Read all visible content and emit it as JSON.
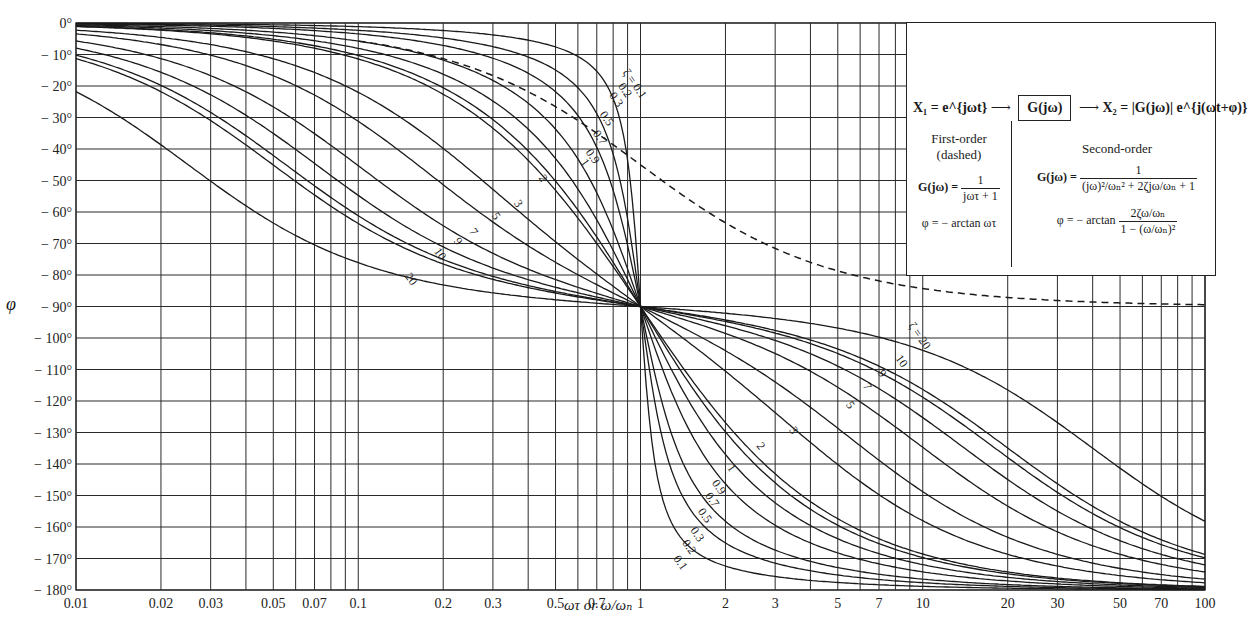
{
  "chart_data": {
    "type": "line",
    "title": "",
    "xlabel": "ωτ or ω/ω_n",
    "ylabel": "φ",
    "x_scale": "log",
    "xlim": [
      0.01,
      100
    ],
    "ylim": [
      -180,
      0
    ],
    "grid": true,
    "x_ticks": [
      "0.01",
      "0.02",
      "0.03",
      "0.05",
      "0.07",
      "0.1",
      "0.2",
      "0.3",
      "0.5",
      "0.7",
      "1",
      "2",
      "3",
      "5",
      "7",
      "10",
      "20",
      "30",
      "50",
      "70",
      "100"
    ],
    "y_ticks": [
      "0°",
      "-10°",
      "-20°",
      "-30°",
      "-40°",
      "-50°",
      "-60°",
      "-70°",
      "-80°",
      "-90°",
      "-100°",
      "-110°",
      "-120°",
      "-130°",
      "-140°",
      "-150°",
      "-160°",
      "-170°",
      "-180°"
    ],
    "series_second_order": {
      "parameter": "ζ",
      "zeta_values": [
        0.1,
        0.2,
        0.3,
        0.5,
        0.7,
        0.9,
        1,
        2,
        3,
        5,
        7,
        9,
        10,
        20
      ],
      "formula": "φ = -arctan(2ζ(ω/ωn) / (1 - (ω/ωn)²))",
      "style": "solid",
      "labels_upper": [
        "ζ = 0.1",
        "0.2",
        "0.3",
        "0.5",
        "0.7",
        "0.9",
        "1",
        "2",
        "3",
        "5",
        "7",
        "9",
        "10",
        "20"
      ],
      "labels_lower": [
        "ζ = 20",
        "10",
        "9",
        "7",
        "5",
        "3",
        "2",
        "1",
        "0.9",
        "0.7",
        "0.5",
        "0.3",
        "0.2",
        "0.1"
      ]
    },
    "series_first_order": {
      "name": "First-order (dashed)",
      "formula": "φ = -arctan ωτ",
      "style": "dashed",
      "points": [
        [
          0.1,
          -5.7
        ],
        [
          0.2,
          -11.3
        ],
        [
          0.5,
          -26.6
        ],
        [
          1,
          -45
        ],
        [
          2,
          -63.4
        ],
        [
          5,
          -78.7
        ],
        [
          10,
          -84.3
        ],
        [
          20,
          -87.1
        ],
        [
          50,
          -88.9
        ],
        [
          100,
          -89.4
        ]
      ]
    },
    "annotations": {
      "crossing_point": {
        "x": 1,
        "y": -90
      }
    }
  },
  "legend": {
    "x1": "X₁ = e^{jωt}",
    "block": "G(jω)",
    "x2": "X₂ = |G(jω)| e^{j(ωt+φ)}",
    "first_order_title": "First-order",
    "first_order_sub": "(dashed)",
    "first_order_G_lhs": "G(jω) =",
    "first_order_G_num": "1",
    "first_order_G_den": "jωτ + 1",
    "first_order_phi": "φ = − arctan ωτ",
    "second_order_title": "Second-order",
    "second_order_G_lhs": "G(jω) =",
    "second_order_G_num": "1",
    "second_order_G_den": "(jω)²/ωₙ² + 2ζjω/ωₙ + 1",
    "second_order_phi_lhs": "φ = − arctan",
    "second_order_phi_num": "2ζω/ωₙ",
    "second_order_phi_den": "1 − (ω/ωₙ)²"
  },
  "axes": {
    "xlabel": "ωτ or ω/ωₙ",
    "ylabel": "φ"
  },
  "colors": {
    "ink": "#1a1a1a",
    "grid": "#2a2a2a",
    "background": "#ffffff"
  }
}
